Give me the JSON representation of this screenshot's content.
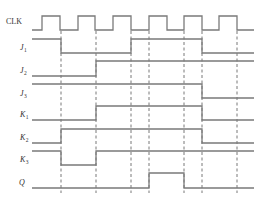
{
  "diagram": {
    "type": "timing-diagram",
    "colors": {
      "wave": "#7a7a7a",
      "dash": "#555555",
      "text": "#333333",
      "background": "#ffffff"
    },
    "x_start": 32,
    "x_end": 254,
    "dashed_lines": {
      "x": [
        61,
        96,
        131,
        149,
        184,
        202,
        237
      ],
      "y_top": 31,
      "y_bottom": 193
    },
    "signals": [
      {
        "id": "clk",
        "label": "CLK",
        "sub": "",
        "italic": false,
        "label_y": 21,
        "high_y": 16,
        "low_y": 30,
        "start": 0,
        "transitions": [
          42,
          60,
          78,
          95,
          113,
          131,
          149,
          167,
          184,
          202,
          219,
          237
        ]
      },
      {
        "id": "j1",
        "label": "J",
        "sub": "1",
        "italic": true,
        "label_y": 47,
        "high_y": 39,
        "low_y": 53,
        "start": 1,
        "transitions": [
          61,
          131,
          202
        ]
      },
      {
        "id": "j2",
        "label": "J",
        "sub": "2",
        "italic": true,
        "label_y": 70,
        "high_y": 61,
        "low_y": 76,
        "start": 0,
        "transitions": [
          96
        ]
      },
      {
        "id": "j3",
        "label": "J",
        "sub": "3",
        "italic": true,
        "label_y": 93,
        "high_y": 84,
        "low_y": 98,
        "start": 1,
        "transitions": [
          202
        ]
      },
      {
        "id": "k1",
        "label": "K",
        "sub": "1",
        "italic": true,
        "label_y": 114,
        "high_y": 106,
        "low_y": 120,
        "start": 0,
        "transitions": [
          96,
          202
        ]
      },
      {
        "id": "k2",
        "label": "K",
        "sub": "2",
        "italic": true,
        "label_y": 137,
        "high_y": 129,
        "low_y": 143,
        "start": 0,
        "transitions": [
          61,
          202
        ]
      },
      {
        "id": "k3",
        "label": "K",
        "sub": "3",
        "italic": true,
        "label_y": 159,
        "high_y": 151,
        "low_y": 165,
        "start": 1,
        "transitions": [
          61,
          96
        ]
      },
      {
        "id": "q",
        "label": "Q",
        "sub": "",
        "italic": true,
        "label_y": 182,
        "high_y": 173,
        "low_y": 188,
        "start": 0,
        "transitions": [
          149,
          184
        ]
      }
    ]
  }
}
